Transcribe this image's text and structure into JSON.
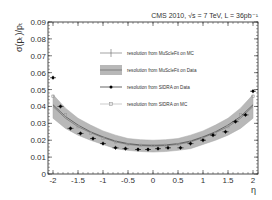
{
  "chart_data": {
    "type": "line",
    "title": "CMS 2010,  √s = 7 TeV,  L = 36pb⁻¹",
    "xlabel": "η",
    "ylabel": "σ(p_T)/p_T",
    "xlim": [
      -2.1,
      2.1
    ],
    "ylim": [
      0,
      0.09
    ],
    "x_ticks": [
      "-2",
      "-1.5",
      "-1",
      "-0.5",
      "0",
      "0.5",
      "1",
      "1.5",
      "2"
    ],
    "y_ticks": [
      "0",
      "0.01",
      "0.02",
      "0.03",
      "0.04",
      "0.05",
      "0.06",
      "0.07",
      "0.08",
      "0.09"
    ],
    "legend_position": "upper-center",
    "series": [
      {
        "name": "resolution from MuScleFit on MC",
        "style": "thin-line",
        "x": [
          -2.0,
          -1.75,
          -1.5,
          -1.25,
          -1.0,
          -0.75,
          -0.5,
          -0.25,
          0.0,
          0.25,
          0.5,
          0.75,
          1.0,
          1.25,
          1.5,
          1.75,
          2.0
        ],
        "values": [
          0.041,
          0.034,
          0.029,
          0.025,
          0.022,
          0.0195,
          0.018,
          0.0172,
          0.017,
          0.0172,
          0.018,
          0.0195,
          0.022,
          0.025,
          0.029,
          0.034,
          0.041
        ]
      },
      {
        "name": "resolution from MuScleFit on Data",
        "style": "shaded-band",
        "x": [
          -2.0,
          -1.75,
          -1.5,
          -1.25,
          -1.0,
          -0.75,
          -0.5,
          -0.25,
          0.0,
          0.25,
          0.5,
          0.75,
          1.0,
          1.25,
          1.5,
          1.75,
          2.0
        ],
        "values": [
          0.04,
          0.033,
          0.028,
          0.0245,
          0.0215,
          0.019,
          0.0175,
          0.0168,
          0.0165,
          0.0168,
          0.0175,
          0.019,
          0.0215,
          0.0245,
          0.028,
          0.033,
          0.04
        ],
        "band_half_width": [
          0.007,
          0.006,
          0.005,
          0.0045,
          0.004,
          0.004,
          0.0035,
          0.0035,
          0.0035,
          0.0035,
          0.0035,
          0.004,
          0.004,
          0.0045,
          0.005,
          0.006,
          0.007
        ]
      },
      {
        "name": "resolution from SIDRA on Data",
        "style": "black-markers",
        "x": [
          -2.0,
          -1.85,
          -1.65,
          -1.45,
          -1.2,
          -1.0,
          -0.75,
          -0.55,
          -0.3,
          -0.1,
          0.1,
          0.3,
          0.55,
          0.75,
          1.0,
          1.2,
          1.45,
          1.65,
          1.85,
          2.0
        ],
        "values": [
          0.057,
          0.04,
          0.027,
          0.024,
          0.021,
          0.018,
          0.0155,
          0.015,
          0.0145,
          0.0145,
          0.015,
          0.0155,
          0.0155,
          0.018,
          0.02,
          0.023,
          0.025,
          0.031,
          0.035,
          0.049
        ]
      },
      {
        "name": "resolution from SIDRA on MC",
        "style": "grey-markers",
        "x": [
          -2.0,
          -1.75,
          -1.5,
          -1.25,
          -1.0,
          -0.75,
          -0.5,
          -0.25,
          0.0,
          0.25,
          0.5,
          0.75,
          1.0,
          1.25,
          1.5,
          1.75,
          2.0
        ],
        "values": [
          0.046,
          0.035,
          0.028,
          0.024,
          0.021,
          0.019,
          0.0175,
          0.017,
          0.0168,
          0.017,
          0.0175,
          0.019,
          0.021,
          0.024,
          0.028,
          0.035,
          0.046
        ]
      }
    ]
  },
  "header": {
    "experiment": "CMS 2010,",
    "energy": "√s = 7 TeV,",
    "luminosity": "L = 36pb⁻¹"
  },
  "axes": {
    "y_label": "σ(p",
    "x_label": "η"
  }
}
